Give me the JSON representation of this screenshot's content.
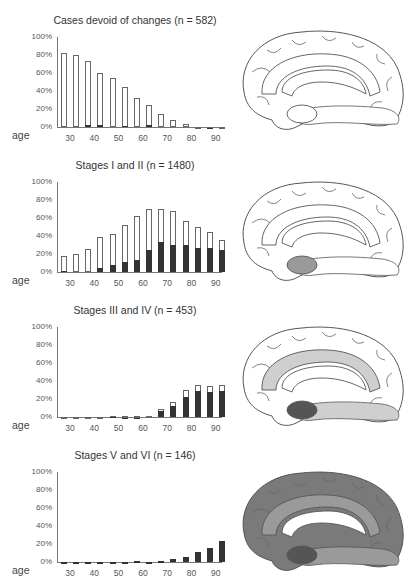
{
  "age_label": "age",
  "y_ticks": [
    "100%",
    "80%",
    "60%",
    "40%",
    "20%",
    "0%"
  ],
  "x_ticks": [
    "30",
    "40",
    "50",
    "60",
    "70",
    "80",
    "90"
  ],
  "chart_data": [
    {
      "type": "bar",
      "title": "Cases devoid of changes (n = 582)",
      "xlabel": "age",
      "ylabel": "",
      "ylim": [
        0,
        100
      ],
      "categories": [
        "25-29",
        "30-34",
        "35-39",
        "40-44",
        "45-49",
        "50-54",
        "55-59",
        "60-64",
        "65-69",
        "70-74",
        "75-79",
        "80-84",
        "85-89",
        "90+"
      ],
      "series": [
        {
          "name": "total (open)",
          "values": [
            82,
            80,
            73,
            60,
            55,
            45,
            32,
            25,
            14,
            8,
            3,
            0.5,
            0.5,
            0
          ]
        },
        {
          "name": "stacked dark",
          "values": [
            0,
            0,
            2,
            2,
            0,
            1,
            0,
            2,
            0,
            0,
            0,
            0,
            0.5,
            0
          ]
        }
      ]
    },
    {
      "type": "bar",
      "title": "Stages I and II (n = 1480)",
      "xlabel": "age",
      "ylabel": "",
      "ylim": [
        0,
        100
      ],
      "categories": [
        "25-29",
        "30-34",
        "35-39",
        "40-44",
        "45-49",
        "50-54",
        "55-59",
        "60-64",
        "65-69",
        "70-74",
        "75-79",
        "80-84",
        "85-89",
        "90+"
      ],
      "series": [
        {
          "name": "total (open)",
          "values": [
            18,
            20,
            26,
            39,
            42,
            52,
            62,
            70,
            70,
            68,
            57,
            50,
            44,
            36
          ]
        },
        {
          "name": "stage II (dark)",
          "values": [
            1,
            0,
            0,
            4,
            8,
            11,
            13,
            25,
            33,
            30,
            30,
            27,
            27,
            24
          ]
        }
      ]
    },
    {
      "type": "bar",
      "title": "Stages III and IV (n = 453)",
      "xlabel": "age",
      "ylabel": "",
      "ylim": [
        0,
        100
      ],
      "categories": [
        "25-29",
        "30-34",
        "35-39",
        "40-44",
        "45-49",
        "50-54",
        "55-59",
        "60-64",
        "65-69",
        "70-74",
        "75-79",
        "80-84",
        "85-89",
        "90+"
      ],
      "series": [
        {
          "name": "total (open)",
          "values": [
            0,
            0,
            0,
            0,
            1,
            1,
            1,
            1,
            9,
            17,
            30,
            36,
            35,
            36
          ]
        },
        {
          "name": "stage IV (dark)",
          "values": [
            0,
            0,
            0,
            0,
            1,
            0.5,
            0.5,
            0,
            7,
            12,
            22,
            29,
            28,
            29
          ]
        }
      ]
    },
    {
      "type": "bar",
      "title": "Stages V and VI (n = 146)",
      "xlabel": "age",
      "ylabel": "",
      "ylim": [
        0,
        100
      ],
      "categories": [
        "25-29",
        "30-34",
        "35-39",
        "40-44",
        "45-49",
        "50-54",
        "55-59",
        "60-64",
        "65-69",
        "70-74",
        "75-79",
        "80-84",
        "85-89",
        "90+"
      ],
      "series": [
        {
          "name": "total (open)",
          "values": [
            0,
            0,
            0,
            0,
            0,
            0.5,
            1.5,
            0.5,
            1.5,
            3,
            6,
            11,
            16,
            23
          ]
        },
        {
          "name": "stage VI (dark)",
          "values": [
            0,
            0,
            0,
            0,
            0,
            0.5,
            1.5,
            0.5,
            1.5,
            3,
            6,
            11,
            16,
            23
          ]
        }
      ]
    }
  ],
  "brains": [
    {
      "label": "medial brain - no changes",
      "shade": "none"
    },
    {
      "label": "medial brain - transentorhinal",
      "shade": "entorhinal"
    },
    {
      "label": "medial brain - limbic",
      "shade": "limbic"
    },
    {
      "label": "medial brain - isocortical",
      "shade": "isocortex"
    }
  ],
  "colors": {
    "bar_dark": "#333333",
    "bar_outline": "#666666",
    "shade_light": "#cfcfcf",
    "shade_mid": "#9a9a9a",
    "shade_dark": "#555555"
  }
}
